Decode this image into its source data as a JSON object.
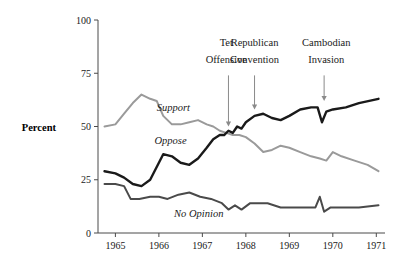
{
  "chart_data": {
    "type": "line",
    "title": "",
    "subtitle": "",
    "xlabel": "",
    "ylabel": "Percent",
    "xlim": [
      1964.6,
      1971.2
    ],
    "ylim": [
      0,
      100
    ],
    "grid": false,
    "legend_position": "inline-labels",
    "x_ticks": [
      "1965",
      "1966",
      "1967",
      "1968",
      "1969",
      "1970",
      "1971"
    ],
    "x_tick_values": [
      1965,
      1966,
      1967,
      1968,
      1969,
      1970,
      1971
    ],
    "y_ticks": [
      "0",
      "25",
      "50",
      "75",
      "100"
    ],
    "y_tick_values": [
      0,
      25,
      50,
      75,
      100
    ],
    "series": [
      {
        "name": "Support",
        "color": "#9a9a9a",
        "label": "Support",
        "label_x": 1965.95,
        "label_y": 57.5,
        "x": [
          1964.75,
          1965.0,
          1965.2,
          1965.4,
          1965.6,
          1965.8,
          1965.95,
          1966.1,
          1966.3,
          1966.5,
          1966.7,
          1966.9,
          1967.1,
          1967.25,
          1967.4,
          1967.55,
          1967.7,
          1967.85,
          1968.0,
          1968.2,
          1968.4,
          1968.6,
          1968.8,
          1969.0,
          1969.25,
          1969.5,
          1969.7,
          1969.85,
          1970.0,
          1970.2,
          1970.5,
          1970.8,
          1971.05
        ],
        "y": [
          50,
          51,
          56,
          61,
          65,
          63,
          62,
          55,
          51,
          51,
          52,
          53,
          51,
          50,
          48,
          47,
          46,
          46,
          45,
          42,
          38,
          39,
          41,
          40,
          38,
          36,
          35,
          34,
          38,
          36,
          34,
          32,
          29
        ]
      },
      {
        "name": "Oppose",
        "color": "#1a1a1a",
        "label": "Oppose",
        "label_x": 1965.9,
        "label_y": 42,
        "x": [
          1964.75,
          1965.0,
          1965.2,
          1965.4,
          1965.6,
          1965.8,
          1965.95,
          1966.1,
          1966.3,
          1966.5,
          1966.7,
          1966.9,
          1967.1,
          1967.25,
          1967.4,
          1967.5,
          1967.6,
          1967.7,
          1967.8,
          1967.9,
          1968.0,
          1968.2,
          1968.4,
          1968.6,
          1968.8,
          1969.0,
          1969.25,
          1969.5,
          1969.65,
          1969.75,
          1969.85,
          1970.0,
          1970.3,
          1970.6,
          1971.05
        ],
        "y": [
          29,
          28,
          26,
          23,
          22,
          25,
          31,
          37,
          36,
          33,
          32,
          35,
          40,
          44,
          46,
          46,
          48,
          47,
          50,
          49,
          52,
          55,
          56,
          54,
          53,
          55,
          58,
          59,
          59,
          52,
          57,
          58,
          59,
          61,
          63
        ]
      },
      {
        "name": "No Opinion",
        "color": "#4a4a4a",
        "label": "No Opinion",
        "label_x": 1966.35,
        "label_y": 7.5,
        "x": [
          1964.75,
          1965.0,
          1965.2,
          1965.35,
          1965.55,
          1965.8,
          1966.0,
          1966.2,
          1966.45,
          1966.7,
          1966.95,
          1967.2,
          1967.45,
          1967.6,
          1967.75,
          1967.9,
          1968.1,
          1968.3,
          1968.5,
          1968.8,
          1969.1,
          1969.4,
          1969.6,
          1969.7,
          1969.8,
          1969.95,
          1970.2,
          1970.6,
          1971.05
        ],
        "y": [
          23,
          23,
          22,
          16,
          16,
          17,
          17,
          16,
          18,
          19,
          17,
          16,
          14,
          11,
          13,
          11,
          14,
          14,
          14,
          12,
          12,
          12,
          12,
          17,
          10,
          12,
          12,
          12,
          13
        ]
      }
    ],
    "annotations": [
      {
        "label_line1": "Tet",
        "label_line2": "Offensive",
        "label_x": 1967.55,
        "label_y1": 88,
        "label_y2": 80,
        "arrow_x": 1967.6,
        "arrow_top_y": 74,
        "arrow_tip_y": 50
      },
      {
        "label_line1": "Republican",
        "label_line2": "Convention",
        "label_x": 1968.2,
        "label_y1": 88,
        "label_y2": 80,
        "arrow_x": 1968.2,
        "arrow_top_y": 74,
        "arrow_tip_y": 58
      },
      {
        "label_line1": "Cambodian",
        "label_line2": "Invasion",
        "label_x": 1969.85,
        "label_y1": 88,
        "label_y2": 80,
        "arrow_x": 1969.8,
        "arrow_top_y": 74,
        "arrow_tip_y": 62
      }
    ]
  },
  "colors": {
    "support": "#9a9a9a",
    "oppose": "#1a1a1a",
    "no_opinion": "#4a4a4a",
    "axis": "#4a4a4a",
    "annotation_arrow": "#8a8a8a",
    "background": "#ffffff"
  }
}
